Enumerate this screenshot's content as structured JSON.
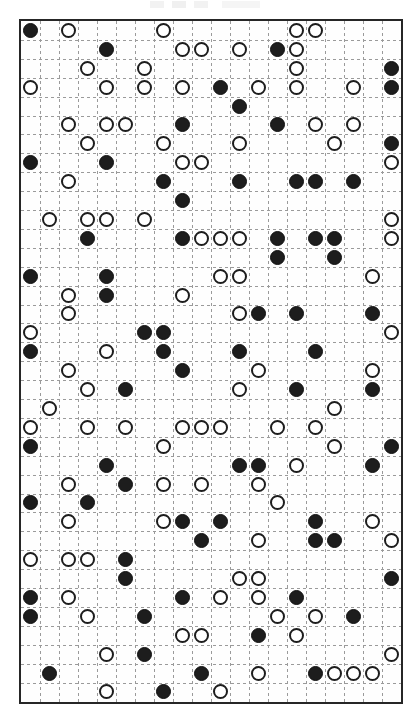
{
  "page": {
    "width": 417,
    "height": 723,
    "background_color": "#ffffff"
  },
  "artifact": {
    "name": "scan-artifact-strip",
    "description": "faint partially cropped marks along the top edge"
  },
  "grid": {
    "left": 19,
    "top": 19,
    "width": 380,
    "height": 681,
    "columns": 20,
    "rows": 36,
    "cell_width": 19,
    "cell_height": 18.9,
    "border_color": "#262626",
    "border_width": 2,
    "gridline_color": "#9a9a9a",
    "gridline_style": "dashed",
    "background_color": "#fefefe"
  },
  "token_styles": {
    "filled": {
      "label": "filled-token",
      "fill": "#1d1d1d",
      "stroke": "#111111",
      "diameter": 15
    },
    "open": {
      "label": "open-token",
      "fill": "#ffffff",
      "stroke": "#1d1d1d",
      "diameter": 15
    }
  },
  "tokens": [
    {
      "row": 0,
      "col": 0,
      "type": "filled"
    },
    {
      "row": 0,
      "col": 2,
      "type": "open"
    },
    {
      "row": 0,
      "col": 7,
      "type": "open"
    },
    {
      "row": 0,
      "col": 14,
      "type": "open"
    },
    {
      "row": 0,
      "col": 15,
      "type": "open"
    },
    {
      "row": 1,
      "col": 4,
      "type": "filled"
    },
    {
      "row": 1,
      "col": 8,
      "type": "open"
    },
    {
      "row": 1,
      "col": 9,
      "type": "open"
    },
    {
      "row": 1,
      "col": 11,
      "type": "open"
    },
    {
      "row": 1,
      "col": 13,
      "type": "filled"
    },
    {
      "row": 1,
      "col": 14,
      "type": "open"
    },
    {
      "row": 2,
      "col": 3,
      "type": "open"
    },
    {
      "row": 2,
      "col": 6,
      "type": "open"
    },
    {
      "row": 2,
      "col": 14,
      "type": "open"
    },
    {
      "row": 2,
      "col": 19,
      "type": "filled"
    },
    {
      "row": 3,
      "col": 0,
      "type": "open"
    },
    {
      "row": 3,
      "col": 4,
      "type": "open"
    },
    {
      "row": 3,
      "col": 6,
      "type": "open"
    },
    {
      "row": 3,
      "col": 8,
      "type": "open"
    },
    {
      "row": 3,
      "col": 10,
      "type": "filled"
    },
    {
      "row": 3,
      "col": 12,
      "type": "open"
    },
    {
      "row": 3,
      "col": 14,
      "type": "open"
    },
    {
      "row": 3,
      "col": 17,
      "type": "open"
    },
    {
      "row": 3,
      "col": 19,
      "type": "filled"
    },
    {
      "row": 4,
      "col": 11,
      "type": "filled"
    },
    {
      "row": 5,
      "col": 2,
      "type": "open"
    },
    {
      "row": 5,
      "col": 4,
      "type": "open"
    },
    {
      "row": 5,
      "col": 5,
      "type": "open"
    },
    {
      "row": 5,
      "col": 8,
      "type": "filled"
    },
    {
      "row": 5,
      "col": 13,
      "type": "filled"
    },
    {
      "row": 5,
      "col": 15,
      "type": "open"
    },
    {
      "row": 5,
      "col": 17,
      "type": "open"
    },
    {
      "row": 6,
      "col": 3,
      "type": "open"
    },
    {
      "row": 6,
      "col": 7,
      "type": "open"
    },
    {
      "row": 6,
      "col": 11,
      "type": "open"
    },
    {
      "row": 6,
      "col": 16,
      "type": "open"
    },
    {
      "row": 6,
      "col": 19,
      "type": "filled"
    },
    {
      "row": 7,
      "col": 0,
      "type": "filled"
    },
    {
      "row": 7,
      "col": 4,
      "type": "filled"
    },
    {
      "row": 7,
      "col": 8,
      "type": "open"
    },
    {
      "row": 7,
      "col": 9,
      "type": "open"
    },
    {
      "row": 7,
      "col": 19,
      "type": "open"
    },
    {
      "row": 8,
      "col": 2,
      "type": "open"
    },
    {
      "row": 8,
      "col": 7,
      "type": "filled"
    },
    {
      "row": 8,
      "col": 11,
      "type": "filled"
    },
    {
      "row": 8,
      "col": 14,
      "type": "filled"
    },
    {
      "row": 8,
      "col": 15,
      "type": "filled"
    },
    {
      "row": 8,
      "col": 17,
      "type": "filled"
    },
    {
      "row": 9,
      "col": 8,
      "type": "filled"
    },
    {
      "row": 10,
      "col": 1,
      "type": "open"
    },
    {
      "row": 10,
      "col": 3,
      "type": "open"
    },
    {
      "row": 10,
      "col": 4,
      "type": "open"
    },
    {
      "row": 10,
      "col": 6,
      "type": "open"
    },
    {
      "row": 10,
      "col": 19,
      "type": "open"
    },
    {
      "row": 11,
      "col": 3,
      "type": "filled"
    },
    {
      "row": 11,
      "col": 8,
      "type": "filled"
    },
    {
      "row": 11,
      "col": 9,
      "type": "open"
    },
    {
      "row": 11,
      "col": 10,
      "type": "open"
    },
    {
      "row": 11,
      "col": 11,
      "type": "open"
    },
    {
      "row": 11,
      "col": 13,
      "type": "filled"
    },
    {
      "row": 11,
      "col": 15,
      "type": "filled"
    },
    {
      "row": 11,
      "col": 16,
      "type": "filled"
    },
    {
      "row": 11,
      "col": 19,
      "type": "open"
    },
    {
      "row": 12,
      "col": 13,
      "type": "filled"
    },
    {
      "row": 12,
      "col": 16,
      "type": "filled"
    },
    {
      "row": 13,
      "col": 0,
      "type": "filled"
    },
    {
      "row": 13,
      "col": 4,
      "type": "filled"
    },
    {
      "row": 13,
      "col": 10,
      "type": "open"
    },
    {
      "row": 13,
      "col": 11,
      "type": "open"
    },
    {
      "row": 13,
      "col": 18,
      "type": "open"
    },
    {
      "row": 14,
      "col": 2,
      "type": "open"
    },
    {
      "row": 14,
      "col": 4,
      "type": "filled"
    },
    {
      "row": 14,
      "col": 8,
      "type": "open"
    },
    {
      "row": 15,
      "col": 2,
      "type": "open"
    },
    {
      "row": 15,
      "col": 11,
      "type": "open"
    },
    {
      "row": 15,
      "col": 12,
      "type": "filled"
    },
    {
      "row": 15,
      "col": 14,
      "type": "filled"
    },
    {
      "row": 15,
      "col": 18,
      "type": "filled"
    },
    {
      "row": 16,
      "col": 0,
      "type": "open"
    },
    {
      "row": 16,
      "col": 6,
      "type": "filled"
    },
    {
      "row": 16,
      "col": 7,
      "type": "filled"
    },
    {
      "row": 16,
      "col": 19,
      "type": "open"
    },
    {
      "row": 17,
      "col": 0,
      "type": "filled"
    },
    {
      "row": 17,
      "col": 4,
      "type": "open"
    },
    {
      "row": 17,
      "col": 7,
      "type": "filled"
    },
    {
      "row": 17,
      "col": 11,
      "type": "filled"
    },
    {
      "row": 17,
      "col": 15,
      "type": "filled"
    },
    {
      "row": 18,
      "col": 2,
      "type": "open"
    },
    {
      "row": 18,
      "col": 8,
      "type": "filled"
    },
    {
      "row": 18,
      "col": 12,
      "type": "open"
    },
    {
      "row": 18,
      "col": 18,
      "type": "open"
    },
    {
      "row": 19,
      "col": 3,
      "type": "open"
    },
    {
      "row": 19,
      "col": 5,
      "type": "filled"
    },
    {
      "row": 19,
      "col": 11,
      "type": "open"
    },
    {
      "row": 19,
      "col": 14,
      "type": "filled"
    },
    {
      "row": 19,
      "col": 18,
      "type": "filled"
    },
    {
      "row": 20,
      "col": 1,
      "type": "open"
    },
    {
      "row": 20,
      "col": 16,
      "type": "open"
    },
    {
      "row": 21,
      "col": 0,
      "type": "open"
    },
    {
      "row": 21,
      "col": 3,
      "type": "open"
    },
    {
      "row": 21,
      "col": 5,
      "type": "open"
    },
    {
      "row": 21,
      "col": 8,
      "type": "open"
    },
    {
      "row": 21,
      "col": 9,
      "type": "open"
    },
    {
      "row": 21,
      "col": 10,
      "type": "open"
    },
    {
      "row": 21,
      "col": 13,
      "type": "open"
    },
    {
      "row": 21,
      "col": 15,
      "type": "open"
    },
    {
      "row": 22,
      "col": 0,
      "type": "filled"
    },
    {
      "row": 22,
      "col": 7,
      "type": "open"
    },
    {
      "row": 22,
      "col": 16,
      "type": "open"
    },
    {
      "row": 22,
      "col": 19,
      "type": "filled"
    },
    {
      "row": 23,
      "col": 4,
      "type": "filled"
    },
    {
      "row": 23,
      "col": 11,
      "type": "filled"
    },
    {
      "row": 23,
      "col": 12,
      "type": "filled"
    },
    {
      "row": 23,
      "col": 14,
      "type": "open"
    },
    {
      "row": 23,
      "col": 18,
      "type": "filled"
    },
    {
      "row": 24,
      "col": 2,
      "type": "open"
    },
    {
      "row": 24,
      "col": 5,
      "type": "filled"
    },
    {
      "row": 24,
      "col": 7,
      "type": "open"
    },
    {
      "row": 24,
      "col": 9,
      "type": "open"
    },
    {
      "row": 24,
      "col": 12,
      "type": "open"
    },
    {
      "row": 25,
      "col": 0,
      "type": "filled"
    },
    {
      "row": 25,
      "col": 3,
      "type": "filled"
    },
    {
      "row": 25,
      "col": 13,
      "type": "open"
    },
    {
      "row": 26,
      "col": 2,
      "type": "open"
    },
    {
      "row": 26,
      "col": 7,
      "type": "open"
    },
    {
      "row": 26,
      "col": 8,
      "type": "filled"
    },
    {
      "row": 26,
      "col": 10,
      "type": "filled"
    },
    {
      "row": 26,
      "col": 15,
      "type": "filled"
    },
    {
      "row": 26,
      "col": 18,
      "type": "open"
    },
    {
      "row": 27,
      "col": 9,
      "type": "filled"
    },
    {
      "row": 27,
      "col": 12,
      "type": "open"
    },
    {
      "row": 27,
      "col": 15,
      "type": "filled"
    },
    {
      "row": 27,
      "col": 16,
      "type": "filled"
    },
    {
      "row": 27,
      "col": 19,
      "type": "open"
    },
    {
      "row": 28,
      "col": 0,
      "type": "open"
    },
    {
      "row": 28,
      "col": 2,
      "type": "open"
    },
    {
      "row": 28,
      "col": 3,
      "type": "open"
    },
    {
      "row": 28,
      "col": 5,
      "type": "filled"
    },
    {
      "row": 29,
      "col": 5,
      "type": "filled"
    },
    {
      "row": 29,
      "col": 11,
      "type": "open"
    },
    {
      "row": 29,
      "col": 12,
      "type": "open"
    },
    {
      "row": 29,
      "col": 19,
      "type": "filled"
    },
    {
      "row": 30,
      "col": 0,
      "type": "filled"
    },
    {
      "row": 30,
      "col": 2,
      "type": "open"
    },
    {
      "row": 30,
      "col": 8,
      "type": "filled"
    },
    {
      "row": 30,
      "col": 10,
      "type": "open"
    },
    {
      "row": 30,
      "col": 12,
      "type": "open"
    },
    {
      "row": 30,
      "col": 14,
      "type": "filled"
    },
    {
      "row": 31,
      "col": 0,
      "type": "filled"
    },
    {
      "row": 31,
      "col": 3,
      "type": "open"
    },
    {
      "row": 31,
      "col": 6,
      "type": "filled"
    },
    {
      "row": 31,
      "col": 13,
      "type": "open"
    },
    {
      "row": 31,
      "col": 15,
      "type": "open"
    },
    {
      "row": 31,
      "col": 17,
      "type": "filled"
    },
    {
      "row": 32,
      "col": 8,
      "type": "open"
    },
    {
      "row": 32,
      "col": 9,
      "type": "open"
    },
    {
      "row": 32,
      "col": 12,
      "type": "filled"
    },
    {
      "row": 32,
      "col": 14,
      "type": "open"
    },
    {
      "row": 33,
      "col": 4,
      "type": "open"
    },
    {
      "row": 33,
      "col": 6,
      "type": "filled"
    },
    {
      "row": 33,
      "col": 19,
      "type": "open"
    },
    {
      "row": 34,
      "col": 1,
      "type": "filled"
    },
    {
      "row": 34,
      "col": 9,
      "type": "filled"
    },
    {
      "row": 34,
      "col": 12,
      "type": "open"
    },
    {
      "row": 34,
      "col": 15,
      "type": "filled"
    },
    {
      "row": 34,
      "col": 16,
      "type": "open"
    },
    {
      "row": 34,
      "col": 17,
      "type": "open"
    },
    {
      "row": 34,
      "col": 18,
      "type": "open"
    },
    {
      "row": 35,
      "col": 4,
      "type": "open"
    },
    {
      "row": 35,
      "col": 7,
      "type": "filled"
    },
    {
      "row": 35,
      "col": 10,
      "type": "open"
    }
  ]
}
